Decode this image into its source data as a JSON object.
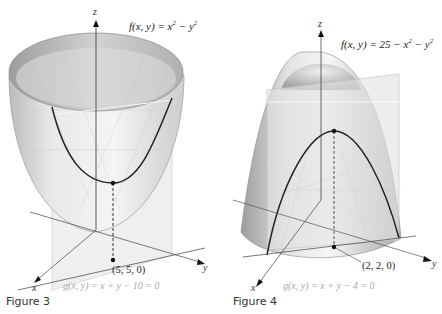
{
  "figures": [
    {
      "caption": "Figure 3",
      "function_label": "f(x, y) = x² − y²",
      "function_parts": {
        "prefix": "f(x, y) = x",
        "exp1": "2",
        "mid": " − y",
        "exp2": "2"
      },
      "constraint_label": "g(x, y) = x + y − 10 = 0",
      "point_label": "(5, 5, 0)",
      "axes": {
        "x": "x",
        "y": "y",
        "z": "z"
      },
      "surface": "bowl-shaped surface opening upward",
      "plane": "vertical plane x + y = 10"
    },
    {
      "caption": "Figure 4",
      "function_label": "f(x, y) = 25 − x² − y²",
      "function_parts": {
        "prefix": "f(x, y) = 25 − x",
        "exp1": "2",
        "mid": " − y",
        "exp2": "2"
      },
      "constraint_label": "g(x, y) = x + y − 4 = 0",
      "point_label": "(2, 2, 0)",
      "axes": {
        "x": "x",
        "y": "y",
        "z": "z"
      },
      "surface": "dome-shaped paraboloid opening downward",
      "plane": "vertical plane x + y = 4"
    }
  ],
  "colors": {
    "surface_light": "#f2f2f2",
    "surface_mid": "#d8d8d8",
    "surface_dark": "#9a9a9a",
    "plane": "#e6e6e6",
    "curve": "#222222",
    "axis": "#333333",
    "constraint_text": "#a8a8a8"
  }
}
